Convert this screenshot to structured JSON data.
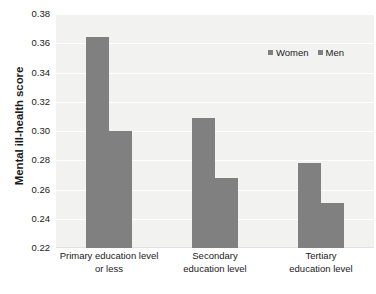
{
  "chart_data": {
    "type": "bar",
    "title": "",
    "xlabel": "",
    "ylabel": "Mental ill-health score",
    "ylim": [
      0.22,
      0.38
    ],
    "ytick_labels": [
      "0.38",
      "0.36",
      "0.34",
      "0.32",
      "0.30",
      "0.28",
      "0.26",
      "0.24",
      "0.22"
    ],
    "ytick_values": [
      0.38,
      0.36,
      0.34,
      0.32,
      0.3,
      0.28,
      0.26,
      0.24,
      0.22
    ],
    "grid": true,
    "legend_position": "top-right",
    "categories": [
      "Primary education level or less",
      "Secondary education level",
      "Tertiary education level"
    ],
    "category_lines": [
      [
        "Primary education level",
        "or less"
      ],
      [
        "Secondary",
        "education level"
      ],
      [
        "Tertiary",
        "education level"
      ]
    ],
    "series": [
      {
        "name": "Women",
        "color": "#808080",
        "values": [
          0.364,
          0.309,
          0.278
        ]
      },
      {
        "name": "Men",
        "color": "#808080",
        "values": [
          0.3,
          0.268,
          0.251
        ]
      }
    ]
  },
  "legend": {
    "items": [
      {
        "label": "Women",
        "color": "#808080"
      },
      {
        "label": "Men",
        "color": "#808080"
      }
    ]
  },
  "colors": {
    "plot_background": "#f2f2f1",
    "gridline": "#ffffff",
    "bar": "#808080",
    "text": "#1a1a1a",
    "page_background": "#ffffff"
  }
}
